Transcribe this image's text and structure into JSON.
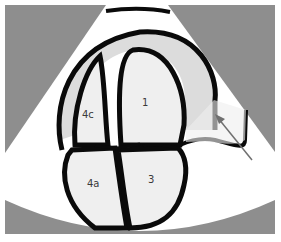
{
  "figure": {
    "colors": {
      "background_gray": "#8e8e8e",
      "sector_fill": "#ffffff",
      "chamber_fill": "#efefef",
      "myocardium_fill": "#dcdcdc",
      "outline": "#0a0a0a",
      "arrow": "#707070"
    },
    "labels": {
      "chamber_4c": "4c",
      "chamber_1": "1",
      "chamber_4a": "4a",
      "chamber_3": "3"
    },
    "arrow": {
      "meaning": "pointer-arrow"
    }
  }
}
